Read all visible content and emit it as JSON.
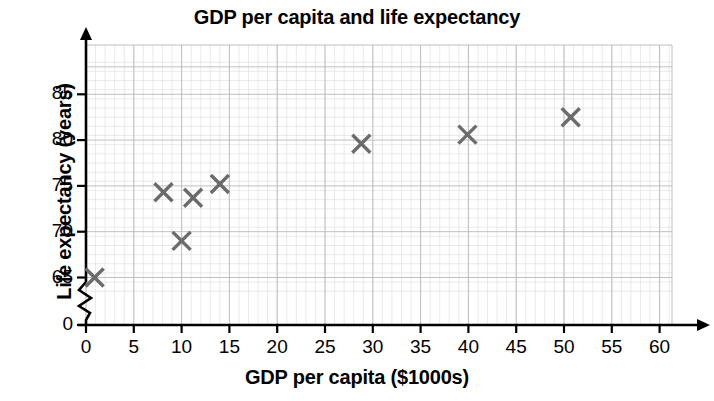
{
  "chart_data": {
    "type": "scatter",
    "title": "GDP per capita and life expectancy",
    "xlabel": "GDP per capita ($1000s)",
    "ylabel": "Life expectancy (years)",
    "xlim": [
      0,
      63
    ],
    "ylim": [
      64,
      88
    ],
    "y_axis_break": true,
    "y_break_note": "zigzag break between 0 and 65",
    "grid": true,
    "grid_minor_step_x": 1,
    "grid_major_step_x": 5,
    "grid_minor_step_y": 1,
    "grid_major_step_y": 5,
    "legend": "none",
    "xticks": [
      0,
      5,
      10,
      15,
      20,
      25,
      30,
      35,
      40,
      45,
      50,
      55,
      60
    ],
    "xtick_labels": [
      "0",
      "5",
      "10",
      "15",
      "20",
      "25",
      "30",
      "35",
      "40",
      "45",
      "50",
      "55",
      "60"
    ],
    "yticks": [
      0,
      65,
      70,
      75,
      80,
      85
    ],
    "ytick_labels": [
      "0",
      "65",
      "70",
      "75",
      "80",
      "85"
    ],
    "marker": "x-cross",
    "marker_color": "#6b6b6b",
    "points": [
      {
        "x": 0.9,
        "y": 65.0
      },
      {
        "x": 8.1,
        "y": 74.3
      },
      {
        "x": 10.0,
        "y": 69.0
      },
      {
        "x": 11.2,
        "y": 73.7
      },
      {
        "x": 14.0,
        "y": 75.2
      },
      {
        "x": 28.8,
        "y": 79.6
      },
      {
        "x": 39.9,
        "y": 80.6
      },
      {
        "x": 50.7,
        "y": 82.5
      }
    ],
    "xvalues": [
      0.9,
      8.1,
      10.0,
      11.2,
      14.0,
      28.8,
      39.9,
      50.7
    ],
    "yvalues": [
      65.0,
      74.3,
      69.0,
      73.7,
      75.2,
      79.6,
      80.6,
      82.5
    ]
  },
  "colors": {
    "marker": "#6b6b6b",
    "axis": "#000000",
    "grid_minor": "#dcdcdc",
    "grid_major": "#b9b9b9",
    "text": "#000000",
    "background": "#ffffff"
  },
  "axes": {
    "x_arrow": true,
    "y_arrow": true
  }
}
